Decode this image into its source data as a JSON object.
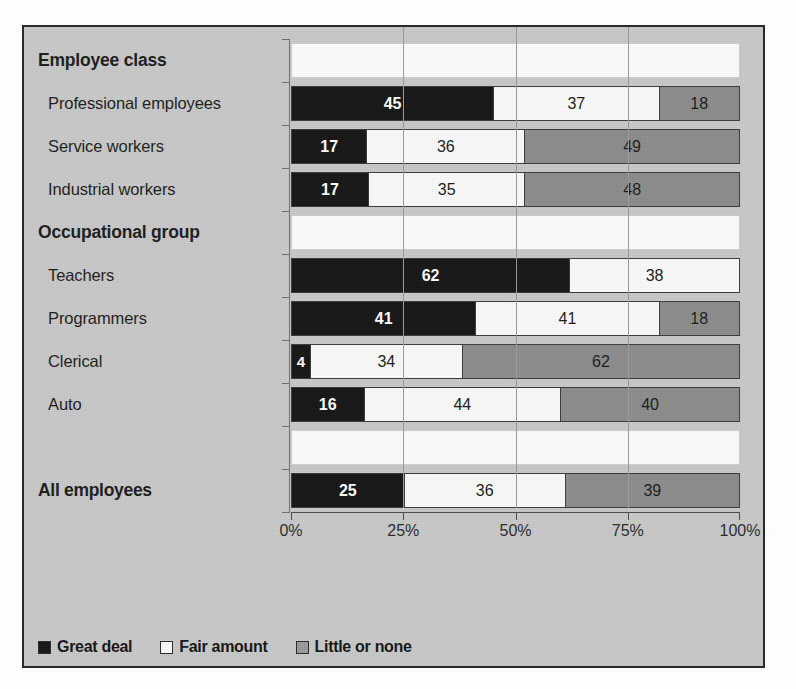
{
  "chart_data": {
    "type": "bar",
    "subtype": "stacked-horizontal-100pct",
    "title": "",
    "xlabel": "",
    "ylabel": "",
    "xlim": [
      0,
      100
    ],
    "xticks": [
      "0%",
      "25%",
      "50%",
      "75%",
      "100%"
    ],
    "xtick_values": [
      0,
      25,
      50,
      75,
      100
    ],
    "grid": true,
    "legend_position": "bottom-left",
    "series": [
      {
        "name": "Great deal",
        "key": "great",
        "color": "#151515"
      },
      {
        "name": "Fair amount",
        "key": "fair",
        "color": "#fbfbfb"
      },
      {
        "name": "Little or none",
        "key": "little",
        "color": "#8c8c8c"
      }
    ],
    "rows": [
      {
        "label": "Employee class",
        "kind": "group",
        "values": null
      },
      {
        "label": "Professional employees",
        "kind": "item",
        "values": [
          45,
          37,
          18
        ]
      },
      {
        "label": "Service workers",
        "kind": "item",
        "values": [
          17,
          36,
          49
        ]
      },
      {
        "label": "Industrial workers",
        "kind": "item",
        "values": [
          17,
          35,
          48
        ]
      },
      {
        "label": "Occupational group",
        "kind": "group",
        "values": null
      },
      {
        "label": "Teachers",
        "kind": "item",
        "values": [
          62,
          38,
          0
        ]
      },
      {
        "label": "Programmers",
        "kind": "item",
        "values": [
          41,
          41,
          18
        ]
      },
      {
        "label": "Clerical",
        "kind": "item",
        "values": [
          4,
          34,
          62
        ]
      },
      {
        "label": "Auto",
        "kind": "item",
        "values": [
          16,
          44,
          40
        ]
      },
      {
        "label": "",
        "kind": "blank",
        "values": null
      },
      {
        "label": "All employees",
        "kind": "total",
        "values": [
          25,
          36,
          39
        ]
      }
    ]
  },
  "legend": {
    "items": [
      {
        "label": "Great deal",
        "swatch": "great"
      },
      {
        "label": "Fair amount",
        "swatch": "fair"
      },
      {
        "label": "Little or none",
        "swatch": "little"
      }
    ]
  }
}
